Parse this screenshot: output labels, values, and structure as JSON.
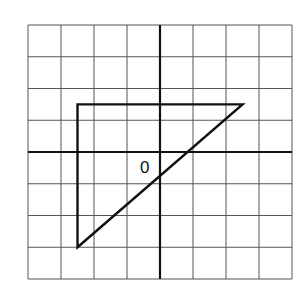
{
  "diagram": {
    "type": "coordinate-grid",
    "grid": {
      "columns": 8,
      "rows": 8,
      "x_range": [
        -4,
        4
      ],
      "y_range": [
        -4,
        4
      ]
    },
    "origin_label": "0",
    "shape": {
      "type": "right-triangle",
      "vertices": [
        [
          -2.5,
          1.5
        ],
        [
          2.5,
          1.5
        ],
        [
          -2.5,
          -3
        ]
      ]
    },
    "colors": {
      "grid": "#555555",
      "axes": "#111111",
      "shape": "#111111",
      "background": "#ffffff"
    }
  }
}
